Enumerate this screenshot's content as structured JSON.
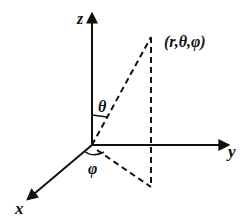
{
  "diagram": {
    "axes": {
      "z_label": "z",
      "y_label": "y",
      "x_label": "x"
    },
    "point_label": "(r,θ,φ)",
    "angles": {
      "polar": "θ",
      "azimuthal": "φ"
    }
  }
}
